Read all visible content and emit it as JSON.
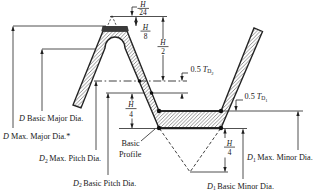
{
  "figure": {
    "type": "screw-thread basic profile tolerance diagram"
  },
  "colors": {
    "background": "#ffffff",
    "ink": "#1f1f1f",
    "hatch": "#555555",
    "crest_fill": "#3a3a3a"
  },
  "dimensions": {
    "h_over_24": {
      "numerator": "H",
      "denominator": "24"
    },
    "h_over_8": {
      "numerator": "H",
      "denominator": "8"
    },
    "h_over_2": {
      "numerator": "H",
      "denominator": "2"
    },
    "h_over_4_upper": {
      "numerator": "H",
      "denominator": "4"
    },
    "h_over_4_lower": {
      "numerator": "H",
      "denominator": "4"
    },
    "half_t_d2": {
      "value": "0.5",
      "variable": "T",
      "subscript": "D",
      "subsubscript": "2"
    },
    "half_t_d1": {
      "value": "0.5",
      "variable": "T",
      "subscript": "D",
      "subsubscript": "1"
    }
  },
  "labels": {
    "basic_profile": {
      "line1": "Basic",
      "line2": "Profile"
    },
    "d_basic_major": {
      "variable": "D",
      "text": "Basic Major Dia."
    },
    "d_max_major": {
      "variable": "D",
      "text": "Max. Major Dia.*"
    },
    "d2_max_pitch": {
      "variable": "D",
      "subscript": "2",
      "text": "Max. Pitch Dia."
    },
    "d2_basic_pitch": {
      "variable": "D",
      "subscript": "2",
      "text": "Basic Pitch Dia."
    },
    "d1_basic_minor": {
      "variable": "D",
      "subscript": "1",
      "text": "Basic Minor Dia."
    },
    "d1_max_minor": {
      "variable": "D",
      "subscript": "1",
      "text": "Max. Minor Dia."
    }
  }
}
